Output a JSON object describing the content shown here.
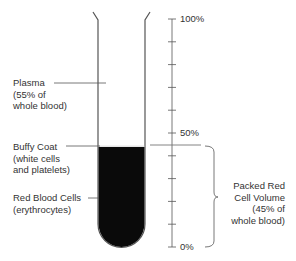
{
  "diagram": {
    "type": "centrifuged-blood-tube",
    "labels": {
      "plasma": [
        "Plasma",
        "(55% of",
        "whole blood)"
      ],
      "buffy_coat": [
        "Buffy Coat",
        "(white cells",
        "and platelets)"
      ],
      "rbc": [
        "Red Blood Cells",
        "(erythrocytes)"
      ],
      "packed": [
        "Packed Red",
        "Cell Volume",
        "(45% of",
        "whole blood)"
      ]
    },
    "scale": {
      "top_label": "100%",
      "mid_label": "50%",
      "bottom_label": "0%",
      "ticks": 10
    },
    "colors": {
      "line": "#555555",
      "blood": "#0a0a0a",
      "text": "#333333"
    }
  }
}
